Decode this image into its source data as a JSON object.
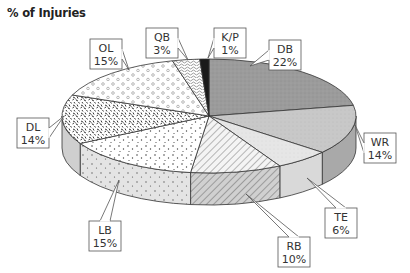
{
  "title": "% of Injuries",
  "chart_data": {
    "type": "pie",
    "title": "% of Injuries",
    "style": "3d-exploded-none",
    "start_angle": "top, clockwise",
    "categories": [
      "DB",
      "WR",
      "TE",
      "RB",
      "LB",
      "DL",
      "OL",
      "QB",
      "K/P"
    ],
    "values": [
      22,
      14,
      6,
      10,
      15,
      14,
      15,
      3,
      1
    ],
    "labels": [
      "22%",
      "14%",
      "6%",
      "10%",
      "15%",
      "14%",
      "15%",
      "3%",
      "1%"
    ],
    "fills": [
      "#9a9a9a",
      "#c6c6c6",
      "#e2e2e2",
      "hatch",
      "dots-fine",
      "speckle-dark",
      "circles",
      "squiggle",
      "#1a1a1a"
    ],
    "legend": "callout boxes",
    "callouts": [
      {
        "name": "DB",
        "value": "22%",
        "box": [
          269,
          40
        ],
        "tip": [
          250,
          66
        ]
      },
      {
        "name": "WR",
        "value": "14%",
        "box": [
          364,
          133
        ],
        "tip": [
          355,
          125
        ]
      },
      {
        "name": "TE",
        "value": "6%",
        "box": [
          325,
          208
        ],
        "tip": [
          307,
          178
        ]
      },
      {
        "name": "RB",
        "value": "10%",
        "box": [
          278,
          237
        ],
        "tip": [
          246,
          194
        ]
      },
      {
        "name": "LB",
        "value": "15%",
        "box": [
          89,
          221
        ],
        "tip": [
          119,
          180
        ]
      },
      {
        "name": "DL",
        "value": "14%",
        "box": [
          17,
          118
        ],
        "tip": [
          64,
          116
        ]
      },
      {
        "name": "OL",
        "value": "15%",
        "box": [
          90,
          39
        ],
        "tip": [
          129,
          70
        ]
      },
      {
        "name": "QB",
        "value": "3%",
        "box": [
          146,
          28
        ],
        "tip": [
          188,
          60
        ]
      },
      {
        "name": "K/P",
        "value": "1%",
        "box": [
          214,
          28
        ],
        "tip": [
          208,
          58
        ]
      }
    ]
  }
}
